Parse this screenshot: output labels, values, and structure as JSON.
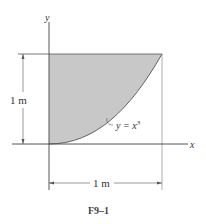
{
  "figure": {
    "caption": "F9–1",
    "axes": {
      "x_label": "x",
      "y_label": "y"
    },
    "curve": {
      "equation_lhs": "y = x",
      "exponent": "3"
    },
    "dimensions": {
      "height": "1 m",
      "width": "1 m"
    },
    "colors": {
      "shaded_region": "#c8c8c8",
      "lines": "#444444"
    }
  }
}
